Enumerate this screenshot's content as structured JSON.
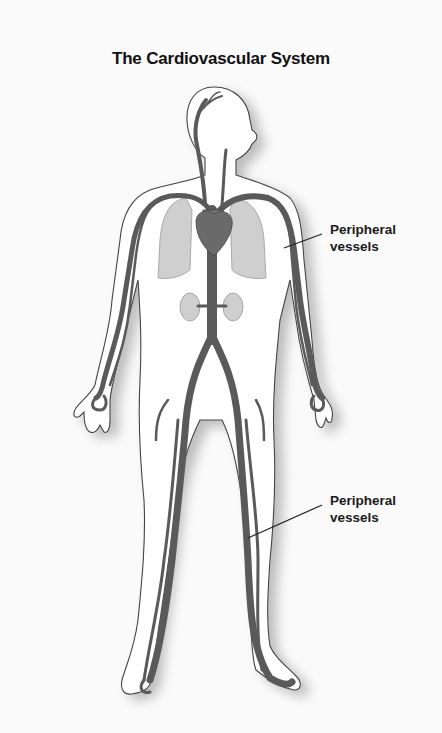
{
  "title": "The Cardiovascular System",
  "labels": [
    {
      "id": "upper",
      "line1": "Peripheral",
      "line2": "vessels"
    },
    {
      "id": "lower",
      "line1": "Peripheral",
      "line2": "vessels"
    }
  ],
  "colors": {
    "background": "#fafafa",
    "skin_fill": "#ffffff",
    "outline": "#444444",
    "vessel": "#5a5a5a",
    "organ_fill": "#c8c8c8",
    "heart": "#6a6a6a",
    "leader_line": "#222222"
  },
  "structures": [
    "head",
    "torso",
    "arms",
    "hands",
    "legs",
    "feet",
    "heart",
    "lungs",
    "kidneys",
    "aorta",
    "peripheral vessels"
  ]
}
